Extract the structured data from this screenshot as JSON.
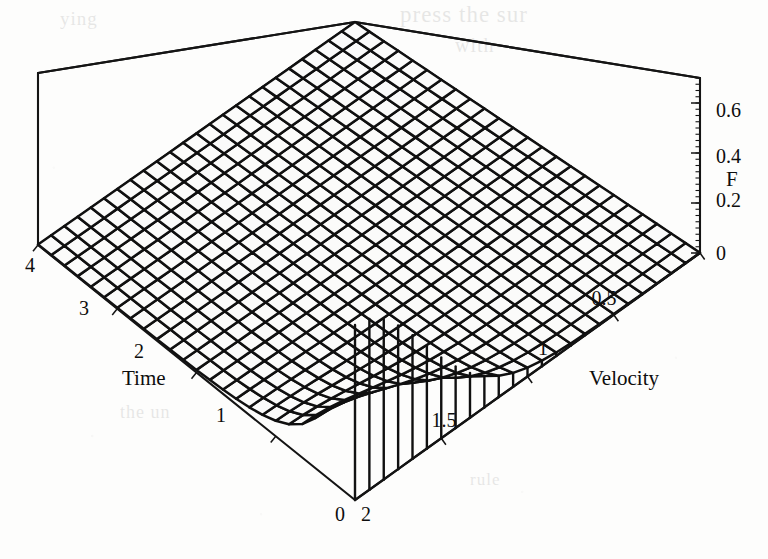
{
  "figure": {
    "kind": "3d-surface-wireframe",
    "background_color": "#fdfdfc",
    "line_color": "#101010",
    "face_color": "#fbfbfa"
  },
  "bleed_through_text": {
    "line1": "press the sur",
    "line2": "with",
    "line3": "ying",
    "line4": "the un",
    "line5": "rule"
  },
  "axes": {
    "x": {
      "name": "Time",
      "label": "Time",
      "range": [
        0,
        4
      ],
      "ticks": [
        0,
        1,
        2,
        3,
        4
      ],
      "tick_labels": [
        "0",
        "1",
        "2",
        "3",
        "4"
      ],
      "visible_tick_labels": [
        "1",
        "2",
        "3",
        "4"
      ],
      "origin_label": "0"
    },
    "y": {
      "name": "Velocity",
      "label": "Velocity",
      "range": [
        0,
        2
      ],
      "ticks": [
        0,
        0.5,
        1,
        1.5,
        2
      ],
      "tick_labels": [
        "0",
        "0.5",
        "1",
        "1.5",
        "2"
      ],
      "visible_tick_labels": [
        "0.5",
        "1",
        "1.5",
        "2"
      ],
      "far_corner_label": "2"
    },
    "z": {
      "name": "F",
      "label": "F",
      "range": [
        0,
        0.7
      ],
      "ticks": [
        0,
        0.2,
        0.4,
        0.6
      ],
      "tick_labels": [
        "0",
        "0.2",
        "0.4",
        "0.6"
      ]
    }
  },
  "chart_data": {
    "type": "surface",
    "title": "",
    "xlabel": "Time",
    "ylabel": "Velocity",
    "zlabel": "F",
    "xlim": [
      0,
      4
    ],
    "ylim": [
      0,
      2
    ],
    "zlim": [
      0,
      0.7
    ],
    "grid": false,
    "legend": "none",
    "mesh_n_x": 24,
    "mesh_n_y": 24,
    "x": [
      0,
      0.1739,
      0.3478,
      0.5217,
      0.6957,
      0.8696,
      1.0435,
      1.2174,
      1.3913,
      1.5652,
      1.7391,
      1.913,
      2.087,
      2.2609,
      2.4348,
      2.6087,
      2.7826,
      2.9565,
      3.1304,
      3.3043,
      3.4783,
      3.6522,
      3.8261,
      4
    ],
    "y": [
      0,
      0.087,
      0.1739,
      0.2609,
      0.3478,
      0.4348,
      0.5217,
      0.6087,
      0.6957,
      0.7826,
      0.8696,
      0.9565,
      1.0435,
      1.1304,
      1.2174,
      1.3043,
      1.3913,
      1.4783,
      1.5652,
      1.6522,
      1.7391,
      1.8261,
      1.913,
      2
    ],
    "z_formula": "F(t,v) = 0.68 * exp(-2.6*t) * exp(-3.1*v^2) + 0.02*exp(-0.55*t)*exp(-1.4*v)",
    "z_peak": 0.68,
    "z_peak_at": {
      "Time": 0,
      "Velocity": 0
    },
    "sample_rows": [
      {
        "Time": 0,
        "F_by_Velocity": [
          0.68,
          0.667,
          0.629,
          0.57,
          0.496,
          0.414,
          0.332,
          0.255,
          0.188,
          0.133,
          0.09,
          0.058,
          0.036,
          0.021,
          0.012,
          0.006,
          0.003,
          0.002,
          0.001,
          0.0,
          0.0,
          0.0,
          0.0,
          0.0
        ]
      },
      {
        "Time": 0.52,
        "F_by_Velocity": [
          0.175,
          0.172,
          0.162,
          0.147,
          0.128,
          0.107,
          0.086,
          0.066,
          0.049,
          0.035,
          0.024,
          0.016,
          0.01,
          0.006,
          0.004,
          0.002,
          0.001,
          0.001,
          0.0,
          0.0,
          0.0,
          0.0,
          0.0,
          0.0
        ]
      },
      {
        "Time": 1.04,
        "F_by_Velocity": [
          0.045,
          0.044,
          0.042,
          0.038,
          0.033,
          0.028,
          0.022,
          0.017,
          0.013,
          0.009,
          0.007,
          0.005,
          0.003,
          0.002,
          0.001,
          0.001,
          0.001,
          0.0,
          0.0,
          0.0,
          0.0,
          0.0,
          0.0,
          0.0
        ]
      },
      {
        "Time": 2.09,
        "F_by_Velocity": [
          0.003,
          0.003,
          0.003,
          0.003,
          0.002,
          0.002,
          0.002,
          0.001,
          0.001,
          0.001,
          0.001,
          0.0,
          0.0,
          0.0,
          0.0,
          0.0,
          0.0,
          0.0,
          0.0,
          0.0,
          0.0,
          0.0,
          0.0,
          0.0
        ]
      },
      {
        "Time": 4,
        "F_by_Velocity": [
          0.0,
          0.0,
          0.0,
          0.0,
          0.0,
          0.0,
          0.0,
          0.0,
          0.0,
          0.0,
          0.0,
          0.0,
          0.0,
          0.0,
          0.0,
          0.0,
          0.0,
          0.0,
          0.0,
          0.0,
          0.0,
          0.0,
          0.0,
          0.0
        ]
      }
    ]
  },
  "projection": {
    "note": "screen coords of the bounding box corners, pixels",
    "base": {
      "x0y0": [
        355,
        500
      ],
      "x1y0": [
        38,
        245
      ],
      "x1y1": [
        355,
        22
      ],
      "x0y1": [
        700,
        253
      ]
    },
    "top": {
      "x1y0": [
        38,
        73
      ],
      "x1y1": [
        355,
        22
      ],
      "x0y1": [
        700,
        78
      ]
    },
    "z_axis_screen": {
      "x": 700,
      "y_at_0": 253,
      "y_at_max": 78
    }
  },
  "tick_positions": {
    "time": [
      {
        "label": "4",
        "x": 30,
        "y": 272
      },
      {
        "label": "3",
        "x": 84,
        "y": 315
      },
      {
        "label": "2",
        "x": 139,
        "y": 358
      },
      {
        "label": "1",
        "x": 221,
        "y": 422
      },
      {
        "label": "0",
        "x": 340,
        "y": 520
      }
    ],
    "velocity": [
      {
        "label": "0.5",
        "x": 604,
        "y": 305
      },
      {
        "label": "1",
        "x": 543,
        "y": 355
      },
      {
        "label": "1.5",
        "x": 444,
        "y": 427
      },
      {
        "label": "2",
        "x": 366,
        "y": 520
      }
    ],
    "f": [
      {
        "label": "0.6",
        "x": 716,
        "y": 117
      },
      {
        "label": "0.4",
        "x": 716,
        "y": 163
      },
      {
        "label": "0.2",
        "x": 716,
        "y": 207
      },
      {
        "label": "0",
        "x": 716,
        "y": 260
      }
    ]
  },
  "axis_title_positions": {
    "time": {
      "x": 122,
      "y": 385
    },
    "velocity": {
      "x": 589,
      "y": 385
    },
    "f": {
      "x": 726,
      "y": 186
    }
  }
}
